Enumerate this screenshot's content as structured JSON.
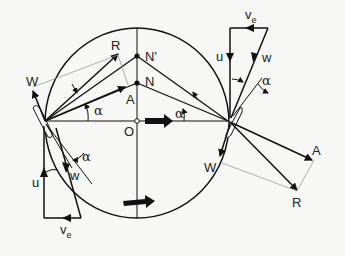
{
  "diagram": {
    "type": "vertical-axis wind turbine (Darrieus) blade velocity and force vector diagram",
    "colors": {
      "background": "#f7f7f6",
      "stroke": "#111111",
      "thin_stroke": "#888888"
    },
    "center_label": "O",
    "points": {
      "n_prime": "N'",
      "n": "N"
    },
    "left_blade": {
      "resultant": "R",
      "lift": "A",
      "drag": "W",
      "angle": "α",
      "velocity_triangle": {
        "u": "u",
        "w": "w",
        "ve": "v",
        "ve_sub": "e"
      },
      "blade_angle": "α"
    },
    "right_blade": {
      "resultant": "R",
      "lift": "A",
      "drag": "W",
      "angle": "α",
      "velocity_triangle": {
        "u": "u",
        "w": "w",
        "ve": "v",
        "ve_sub": "e"
      },
      "blade_angle": "α"
    },
    "wind_direction_icon": "thick-arrow-right",
    "rotation_direction_icon": "thick-arrow-right"
  }
}
